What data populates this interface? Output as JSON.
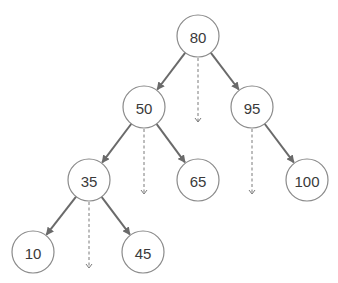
{
  "diagram": {
    "type": "binary-search-tree",
    "colors": {
      "edge": "#6a6a6a",
      "node_stroke": "#8a8a8a",
      "label": "#3a3a3a",
      "dashed": "#7a7a7a"
    },
    "nodes": [
      {
        "id": "n80",
        "label": "80",
        "x": 198,
        "y": 36
      },
      {
        "id": "n50",
        "label": "50",
        "x": 144,
        "y": 107
      },
      {
        "id": "n95",
        "label": "95",
        "x": 252,
        "y": 107
      },
      {
        "id": "n35",
        "label": "35",
        "x": 89,
        "y": 180
      },
      {
        "id": "n65",
        "label": "65",
        "x": 198,
        "y": 180
      },
      {
        "id": "n100",
        "label": "100",
        "x": 307,
        "y": 180
      },
      {
        "id": "n10",
        "label": "10",
        "x": 33,
        "y": 252
      },
      {
        "id": "n45",
        "label": "45",
        "x": 143,
        "y": 252
      }
    ],
    "edges": [
      {
        "from": "80",
        "to": "50"
      },
      {
        "from": "80",
        "to": "95"
      },
      {
        "from": "50",
        "to": "35"
      },
      {
        "from": "50",
        "to": "65"
      },
      {
        "from": "95",
        "to": "100"
      },
      {
        "from": "35",
        "to": "10"
      },
      {
        "from": "35",
        "to": "45"
      }
    ],
    "dashed_arrows": [
      {
        "from": "80",
        "x": 198,
        "y1": 58,
        "y2": 122
      },
      {
        "from": "50",
        "x": 144,
        "y1": 129,
        "y2": 194
      },
      {
        "from": "95",
        "x": 252,
        "y1": 129,
        "y2": 194
      },
      {
        "from": "35",
        "x": 89,
        "y1": 202,
        "y2": 268
      }
    ]
  }
}
